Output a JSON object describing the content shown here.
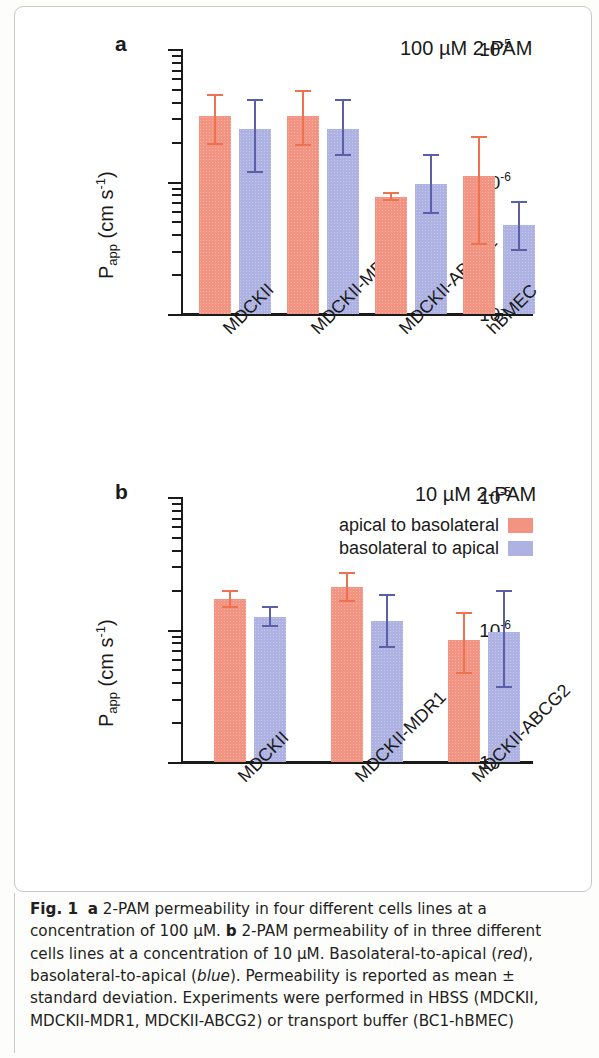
{
  "figure": {
    "caption_label": "Fig. 1",
    "caption_text_parts": {
      "p1": " 2-PAM permeability in four different cells lines at a concentration of 100 µM. ",
      "p2": " 2-PAM permeability of in three different cells lines at a concentration of 10 µM. Basolateral-to-apical (",
      "red_word": "red",
      "p3": "), basolateral-to-apical (",
      "blue_word": "blue",
      "p4": "). Permeability is reported as mean ± standard deviation. Experiments were performed in HBSS (MDCKII, MDCKII-MDR1, MDCKII-ABCG2) or transport buffer (BC1-hBMEC)",
      "bold_a": "a",
      "bold_b": "b"
    }
  },
  "panel_a": {
    "letter": "a",
    "annotation": "100 µM 2-PAM",
    "y_axis_title_main": "P",
    "y_axis_title_sub": "app",
    "y_axis_title_rest": " (cm s",
    "y_axis_title_sup": "-1",
    "y_axis_title_close": ")",
    "y_ticks": [
      {
        "label_base": "10",
        "label_exp": "-5",
        "value": 1e-05
      },
      {
        "label_base": "10",
        "label_exp": "-6",
        "value": 1e-06
      },
      {
        "label_base": "10",
        "label_exp": "-7",
        "value": 1e-07
      }
    ],
    "categories": [
      "MDCKII",
      "MDCKII-MDR1",
      "MDCKII-ABCG2",
      "hBMEC"
    ]
  },
  "panel_b": {
    "letter": "b",
    "annotation": "10 µM 2-PAM",
    "y_axis_title_main": "P",
    "y_axis_title_sub": "app",
    "y_axis_title_rest": " (cm s",
    "y_axis_title_sup": "-1",
    "y_axis_title_close": ")",
    "y_ticks": [
      {
        "label_base": "10",
        "label_exp": "-5",
        "value": 1e-05
      },
      {
        "label_base": "10",
        "label_exp": "-6",
        "value": 1e-06
      },
      {
        "label_base": "10",
        "label_exp": "-7",
        "value": 1e-07
      }
    ],
    "categories": [
      "MDCKII",
      "MDCKII-MDR1",
      "MDCKII-ABCG2"
    ],
    "legend": [
      {
        "label": "apical to basolateral",
        "color": "#f29481"
      },
      {
        "label": "basolateral to apical",
        "color": "#aeb2e2"
      }
    ]
  },
  "colors": {
    "red": "#f29481",
    "red_error": "#ee7250",
    "blue": "#aeb2e2",
    "blue_error": "#5a5fa8",
    "axis": "#1a1a1a",
    "text": "#231f20"
  },
  "chart_data": [
    {
      "type": "bar",
      "id": "panel_a",
      "title": "100 µM 2-PAM",
      "panel_label": "a",
      "xlabel": "",
      "ylabel": "Papp (cm s-1)",
      "yscale": "log",
      "ylim": [
        1e-07,
        1e-05
      ],
      "ytick_values": [
        1e-05,
        1e-06,
        1e-07
      ],
      "ytick_labels": [
        "10-5",
        "10-6",
        "10-7"
      ],
      "grid": false,
      "legend_position": "none",
      "categories": [
        "MDCKII",
        "MDCKII-MDR1",
        "MDCKII-ABCG2",
        "hBMEC"
      ],
      "series": [
        {
          "name": "apical to basolateral",
          "color": "#f29481",
          "values": [
            3.1e-06,
            3.1e-06,
            7.6e-07,
            1.1e-06
          ],
          "err_low": [
            1.9e-06,
            1.85e-06,
            7.1e-07,
            3.3e-07
          ],
          "err_high": [
            4.6e-06,
            4.9e-06,
            8.4e-07,
            2.2e-06
          ]
        },
        {
          "name": "basolateral to apical",
          "color": "#aeb2e2",
          "values": [
            2.5e-06,
            2.5e-06,
            9.5e-07,
            4.7e-07
          ],
          "err_low": [
            1.15e-06,
            1.55e-06,
            5.7e-07,
            3e-07
          ],
          "err_high": [
            4.2e-06,
            4.2e-06,
            1.6e-06,
            7.1e-07
          ]
        }
      ]
    },
    {
      "type": "bar",
      "id": "panel_b",
      "title": "10 µM 2-PAM",
      "panel_label": "b",
      "xlabel": "",
      "ylabel": "Papp (cm s-1)",
      "yscale": "log",
      "ylim": [
        1e-07,
        1e-05
      ],
      "ytick_values": [
        1e-05,
        1e-06,
        1e-07
      ],
      "ytick_labels": [
        "10-5",
        "10-6",
        "10-7"
      ],
      "grid": false,
      "legend_position": "upper right",
      "categories": [
        "MDCKII",
        "MDCKII-MDR1",
        "MDCKII-ABCG2"
      ],
      "series": [
        {
          "name": "apical to basolateral",
          "color": "#f29481",
          "values": [
            1.7e-06,
            2.1e-06,
            8.3e-07
          ],
          "err_low": [
            1.45e-06,
            1.6e-06,
            4.6e-07
          ],
          "err_high": [
            2e-06,
            2.7e-06,
            1.35e-06
          ]
        },
        {
          "name": "basolateral to apical",
          "color": "#aeb2e2",
          "values": [
            1.25e-06,
            1.15e-06,
            9.6e-07
          ],
          "err_low": [
            1.05e-06,
            7.2e-07,
            3.6e-07
          ],
          "err_high": [
            1.5e-06,
            1.85e-06,
            2e-06
          ]
        }
      ]
    }
  ]
}
